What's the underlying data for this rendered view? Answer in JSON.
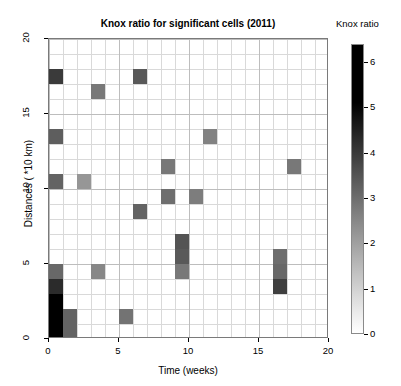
{
  "chart_data": {
    "type": "heatmap",
    "title": "Knox ratio for significant cells (2011)",
    "xlabel": "Time (weeks)",
    "ylabel": "Distances ( *10 km)",
    "xlim": [
      0,
      20
    ],
    "ylim": [
      0,
      20
    ],
    "xticks": [
      "0",
      "5",
      "10",
      "15",
      "20"
    ],
    "yticks": [
      "0",
      "5",
      "10",
      "15",
      "20"
    ],
    "grid": true,
    "cell_size": [
      1,
      1
    ],
    "colorbar": {
      "title": "Knox ratio",
      "position": "right",
      "vmin": 0,
      "vmax": 6.4,
      "ticks": [
        "0",
        "1",
        "2",
        "3",
        "4",
        "5",
        "6"
      ],
      "colormap": "grayscale-inverted",
      "low_color": "#ffffff",
      "high_color": "#000000"
    },
    "background_color": "#ffffff",
    "grid_color": "#d9d9d9",
    "axis_color": "#7a7a7a",
    "cells": [
      {
        "x": 0,
        "y": 0,
        "value": 6.4
      },
      {
        "x": 0,
        "y": 1,
        "value": 6.4
      },
      {
        "x": 0,
        "y": 2,
        "value": 5.0
      },
      {
        "x": 0,
        "y": 3,
        "value": 4.3
      },
      {
        "x": 0,
        "y": 4,
        "value": 3.1
      },
      {
        "x": 0,
        "y": 10,
        "value": 3.2
      },
      {
        "x": 0,
        "y": 13,
        "value": 3.3
      },
      {
        "x": 0,
        "y": 17,
        "value": 4.0
      },
      {
        "x": 1,
        "y": 0,
        "value": 3.2
      },
      {
        "x": 1,
        "y": 1,
        "value": 3.2
      },
      {
        "x": 2,
        "y": 10,
        "value": 2.2
      },
      {
        "x": 3,
        "y": 4,
        "value": 2.5
      },
      {
        "x": 3,
        "y": 16,
        "value": 2.8
      },
      {
        "x": 5,
        "y": 1,
        "value": 2.9
      },
      {
        "x": 6,
        "y": 8,
        "value": 3.2
      },
      {
        "x": 6,
        "y": 17,
        "value": 3.4
      },
      {
        "x": 8,
        "y": 9,
        "value": 3.0
      },
      {
        "x": 8,
        "y": 11,
        "value": 2.8
      },
      {
        "x": 9,
        "y": 4,
        "value": 2.8
      },
      {
        "x": 9,
        "y": 5,
        "value": 3.4
      },
      {
        "x": 9,
        "y": 6,
        "value": 3.5
      },
      {
        "x": 10,
        "y": 9,
        "value": 2.7
      },
      {
        "x": 11,
        "y": 13,
        "value": 2.6
      },
      {
        "x": 16,
        "y": 3,
        "value": 3.9
      },
      {
        "x": 16,
        "y": 4,
        "value": 3.1
      },
      {
        "x": 16,
        "y": 5,
        "value": 3.0
      },
      {
        "x": 17,
        "y": 11,
        "value": 2.8
      }
    ]
  }
}
